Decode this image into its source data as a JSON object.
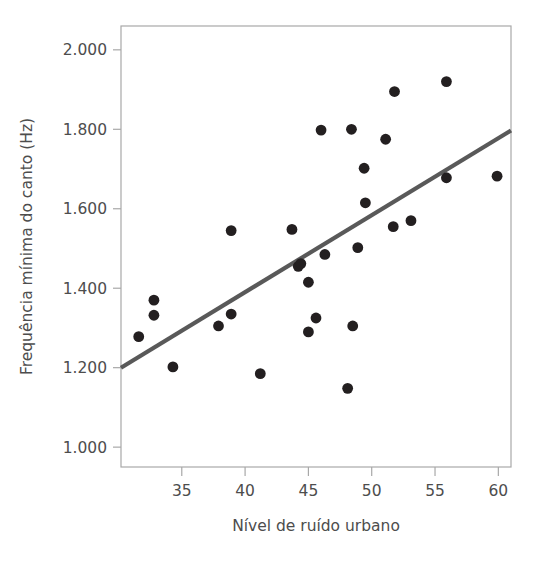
{
  "chart_data": {
    "type": "scatter",
    "title": "",
    "subtitle": "",
    "xlabel": "Nível de ruído urbano",
    "ylabel": "Frequência mínima do canto (Hz)",
    "xlim": [
      30.2,
      61.0
    ],
    "ylim": [
      950,
      2060
    ],
    "grid": false,
    "legend": null,
    "x_ticks": [
      35,
      40,
      45,
      50,
      55,
      60
    ],
    "x_tick_labels": [
      "35",
      "40",
      "45",
      "50",
      "55",
      "60"
    ],
    "y_ticks": [
      1000,
      1200,
      1400,
      1600,
      1800,
      2000
    ],
    "y_tick_labels": [
      "1.000",
      "1.200",
      "1.400",
      "1.600",
      "1.800",
      "2.000"
    ],
    "decimal_separator_note": "period used as thousands separator",
    "point_color": "#231f20",
    "line_color": "#595959",
    "axis_color": "#a8a8a8",
    "text_color": "#4d4d4d",
    "marker_radius_px": 5.4,
    "points": [
      {
        "x": 31.6,
        "y": 1278
      },
      {
        "x": 32.8,
        "y": 1370
      },
      {
        "x": 32.8,
        "y": 1332
      },
      {
        "x": 34.3,
        "y": 1202
      },
      {
        "x": 37.9,
        "y": 1305
      },
      {
        "x": 38.9,
        "y": 1545
      },
      {
        "x": 38.9,
        "y": 1335
      },
      {
        "x": 41.2,
        "y": 1185
      },
      {
        "x": 43.7,
        "y": 1548
      },
      {
        "x": 44.2,
        "y": 1455
      },
      {
        "x": 44.4,
        "y": 1462
      },
      {
        "x": 45.0,
        "y": 1415
      },
      {
        "x": 45.0,
        "y": 1290
      },
      {
        "x": 45.6,
        "y": 1325
      },
      {
        "x": 46.0,
        "y": 1798
      },
      {
        "x": 46.3,
        "y": 1485
      },
      {
        "x": 48.1,
        "y": 1148
      },
      {
        "x": 48.4,
        "y": 1800
      },
      {
        "x": 48.5,
        "y": 1305
      },
      {
        "x": 48.9,
        "y": 1502
      },
      {
        "x": 49.4,
        "y": 1702
      },
      {
        "x": 49.5,
        "y": 1615
      },
      {
        "x": 51.1,
        "y": 1775
      },
      {
        "x": 51.7,
        "y": 1555
      },
      {
        "x": 51.8,
        "y": 1895
      },
      {
        "x": 53.1,
        "y": 1570
      },
      {
        "x": 55.9,
        "y": 1920
      },
      {
        "x": 55.9,
        "y": 1678
      },
      {
        "x": 59.9,
        "y": 1682
      }
    ],
    "trend_line": {
      "x_start": 30.2,
      "y_start": 1200,
      "x_end": 61.0,
      "y_end": 1797,
      "style": "solid"
    }
  }
}
